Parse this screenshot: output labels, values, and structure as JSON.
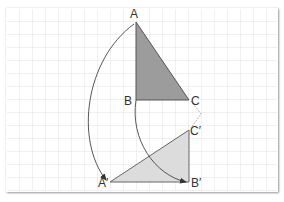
{
  "diagram": {
    "type": "rotation-of-triangle",
    "grid": {
      "cell_px": 13,
      "line_color": "#e0e0e0"
    },
    "original_triangle": {
      "vertices": [
        "A",
        "B",
        "C"
      ],
      "fill": "#9a9a9a"
    },
    "image_triangle": {
      "vertices": [
        "A′",
        "B′",
        "C′"
      ],
      "fill": "#dedede"
    },
    "labels": {
      "A": "A",
      "B": "B",
      "C": "C",
      "A_prime": "A′",
      "B_prime": "B′",
      "C_prime": "C′"
    },
    "arrows": [
      {
        "from": "A",
        "to": "A′"
      },
      {
        "from": "B",
        "to": "B′"
      }
    ]
  }
}
